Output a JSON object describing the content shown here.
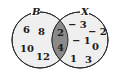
{
  "diagram": {
    "type": "venn",
    "colors": {
      "circle_fill": "#efefef",
      "intersection_fill": "#8a8a8a",
      "stroke": "#2a2a2a",
      "background": "#ffffff"
    },
    "sets": [
      {
        "label": "B",
        "only": [
          "6",
          "8",
          "10",
          "12"
        ]
      },
      {
        "label": "X",
        "only": [
          "-3",
          "-2",
          "-1",
          "0",
          "1",
          "3"
        ]
      }
    ],
    "intersection": [
      "2",
      "4"
    ]
  }
}
